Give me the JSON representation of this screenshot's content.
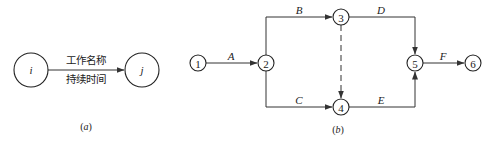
{
  "diagram_a": {
    "caption_open": "(",
    "caption_letter": "a",
    "caption_close": ")",
    "start_node": "i",
    "end_node": "j",
    "edge_label_top": "工作名称",
    "edge_label_bottom": "持续时间"
  },
  "diagram_b": {
    "caption_open": "(",
    "caption_letter": "b",
    "caption_close": ")",
    "nodes": [
      "1",
      "2",
      "3",
      "4",
      "5",
      "6"
    ],
    "edges": [
      {
        "from": "1",
        "to": "2",
        "label": "A",
        "style": "solid"
      },
      {
        "from": "2",
        "to": "3",
        "label": "B",
        "style": "solid"
      },
      {
        "from": "2",
        "to": "4",
        "label": "C",
        "style": "solid"
      },
      {
        "from": "3",
        "to": "5",
        "label": "D",
        "style": "solid"
      },
      {
        "from": "4",
        "to": "5",
        "label": "E",
        "style": "solid"
      },
      {
        "from": "5",
        "to": "6",
        "label": "F",
        "style": "solid"
      },
      {
        "from": "3",
        "to": "4",
        "label": "",
        "style": "dashed"
      }
    ]
  }
}
